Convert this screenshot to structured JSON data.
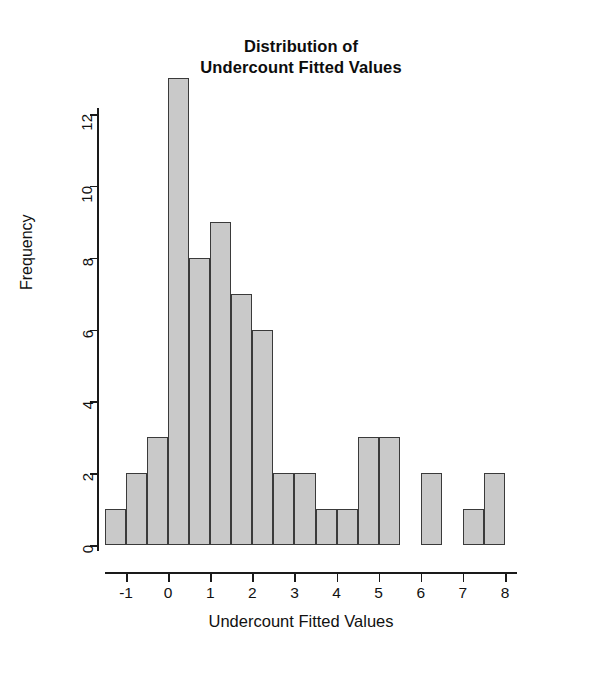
{
  "chart_data": {
    "type": "bar",
    "title": "Distribution of Undercount Fitted Values",
    "title_line1": "Distribution of",
    "title_line2": "Undercount Fitted Values",
    "xlabel": "Undercount Fitted Values",
    "ylabel": "Frequency",
    "bin_width": 0.5,
    "bin_edges": [
      -1.5,
      -1.0,
      -0.5,
      0.0,
      0.5,
      1.0,
      1.5,
      2.0,
      2.5,
      3.0,
      3.5,
      4.0,
      4.5,
      5.0,
      5.5,
      6.0,
      6.5,
      7.0,
      7.5,
      8.0
    ],
    "categories": [
      "-1.5 to -1.0",
      "-1.0 to -0.5",
      "-0.5 to 0.0",
      "0.0 to 0.5",
      "0.5 to 1.0",
      "1.0 to 1.5",
      "1.5 to 2.0",
      "2.0 to 2.5",
      "2.5 to 3.0",
      "3.0 to 3.5",
      "3.5 to 4.0",
      "4.0 to 4.5",
      "4.5 to 5.0",
      "5.0 to 5.5",
      "5.5 to 6.0",
      "6.0 to 6.5",
      "6.5 to 7.0",
      "7.0 to 7.5",
      "7.5 to 8.0"
    ],
    "values": [
      1,
      2,
      3,
      13,
      8,
      9,
      7,
      6,
      2,
      2,
      1,
      1,
      3,
      3,
      0,
      2,
      0,
      1,
      2
    ],
    "xlim": [
      -1.5,
      8.0
    ],
    "ylim": [
      0,
      13
    ],
    "xticks": [
      -1,
      0,
      1,
      2,
      3,
      4,
      5,
      6,
      7,
      8
    ],
    "xtick_labels": [
      "-1",
      "0",
      "1",
      "2",
      "3",
      "4",
      "5",
      "6",
      "7",
      "8"
    ],
    "yticks": [
      0,
      2,
      4,
      6,
      8,
      10,
      12
    ],
    "ytick_labels": [
      "0",
      "2",
      "4",
      "6",
      "8",
      "10",
      "12"
    ],
    "grid": false,
    "legend": false,
    "bar_fill_color": "#c9c9c9",
    "bar_border_color": "#3a3a3a",
    "axis_color": "#1a1a1a",
    "background_color": "#ffffff"
  }
}
